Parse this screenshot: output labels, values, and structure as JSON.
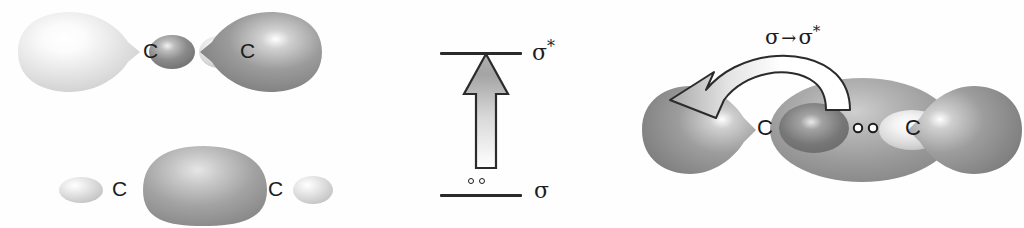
{
  "figure": {
    "atom_symbol": "C"
  },
  "panels": {
    "antibonding": {
      "name": "sigma-star antibonding orbital",
      "atoms": [
        {
          "label": "C"
        },
        {
          "label": "C"
        }
      ]
    },
    "bonding": {
      "name": "sigma bonding orbital",
      "atoms": [
        {
          "label": "C"
        },
        {
          "label": "C"
        }
      ]
    },
    "energy_diagram": {
      "name": "energy level diagram",
      "upper_level_label": "σ",
      "upper_level_star": "*",
      "lower_level_label": "σ",
      "electron_count": 2,
      "arrow_direction": "up"
    },
    "excitation": {
      "name": "sigma to sigma star excitation",
      "transition_label_sigma": "σ",
      "transition_label_arrow": "→",
      "transition_label_sigma_star": "σ",
      "transition_label_star": "*",
      "atoms": [
        {
          "label": "C"
        },
        {
          "label": "C"
        }
      ],
      "electron_count": 2
    }
  },
  "colors": {
    "ink": "#1c1c1c",
    "lobe_dark": "#8d8d8d",
    "lobe_darker": "#6f6f6f",
    "lobe_light": "#d9d9d9",
    "lobe_pale": "#efefef",
    "highlight": "#ffffff",
    "arrow_fill": "#ffffff",
    "arrow_shade": "#9a9a9a"
  }
}
